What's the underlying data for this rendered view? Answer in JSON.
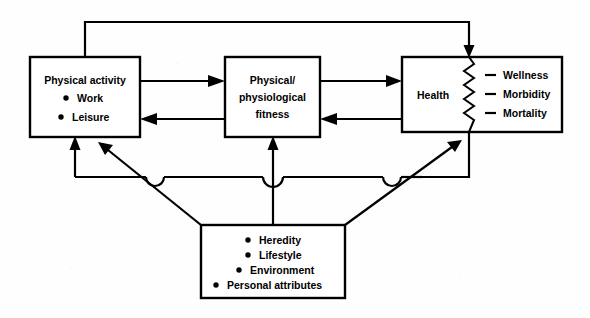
{
  "diagram": {
    "background_color": "#ffffff",
    "line_color": "#000000",
    "boxes": {
      "physical_activity": {
        "name": "Physical activity",
        "title": "Physical activity",
        "items": [
          "Work",
          "Leisure"
        ],
        "bullet": "•"
      },
      "fitness": {
        "name": "Physical/physiological fitness",
        "line1": "Physical/",
        "line2": "physiological",
        "line3": "fitness"
      },
      "health": {
        "name": "Health",
        "title": "Health",
        "outcomes": [
          "Wellness",
          "Morbidity",
          "Mortality"
        ],
        "outcome_marker": "—",
        "divider": "zigzag"
      },
      "determinants": {
        "name": "Determinants",
        "items": [
          "Heredity",
          "Lifestyle",
          "Environment",
          "Personal attributes"
        ],
        "bullet": "•"
      }
    },
    "connectors": [
      {
        "id": "activity-to-fitness",
        "from": "Physical activity",
        "to": "Physical/physiological fitness",
        "direction": "right",
        "arrow": true
      },
      {
        "id": "fitness-to-activity",
        "from": "Physical/physiological fitness",
        "to": "Physical activity",
        "direction": "left",
        "arrow": true
      },
      {
        "id": "fitness-to-health",
        "from": "Physical/physiological fitness",
        "to": "Health",
        "direction": "right",
        "arrow": true
      },
      {
        "id": "health-to-fitness",
        "from": "Health",
        "to": "Physical/physiological fitness",
        "direction": "left",
        "arrow": true
      },
      {
        "id": "activity-to-health-feedback",
        "from": "Physical activity",
        "to": "Health",
        "direction": "top-loop",
        "arrow": true
      },
      {
        "id": "determinants-to-activity",
        "from": "Determinants",
        "to": "Physical activity",
        "direction": "up",
        "arrow": true
      },
      {
        "id": "determinants-to-fitness",
        "from": "Determinants",
        "to": "Physical/physiological fitness",
        "direction": "up",
        "arrow": true
      },
      {
        "id": "determinants-diagonal-left",
        "from": "Determinants",
        "to": "Physical activity",
        "direction": "diagonal-up-left",
        "arrow": true
      },
      {
        "id": "determinants-diagonal-right",
        "from": "Determinants",
        "to": "Health",
        "direction": "diagonal-up-right",
        "arrow": true
      },
      {
        "id": "health-bus-down",
        "from": "Health",
        "to": "distribution bus",
        "direction": "down",
        "arrow": false
      }
    ]
  }
}
